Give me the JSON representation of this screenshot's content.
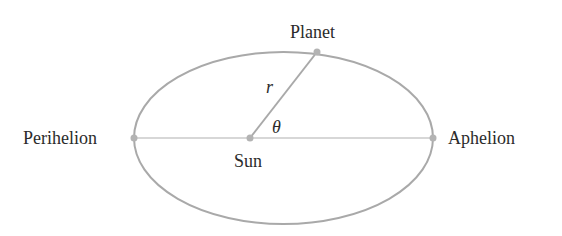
{
  "diagram": {
    "type": "orbit-ellipse",
    "labels": {
      "planet": "Planet",
      "sun": "Sun",
      "perihelion": "Perihelion",
      "aphelion": "Aphelion",
      "radius": "r",
      "angle": "θ"
    },
    "colors": {
      "stroke": "#a9a9a9",
      "text": "#2b2b2b",
      "point": "#b3b3b3"
    }
  }
}
